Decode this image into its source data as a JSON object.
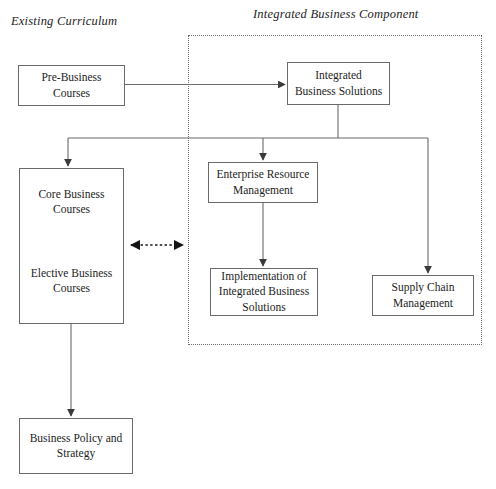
{
  "diagram": {
    "type": "flowchart",
    "title_labels": {
      "existing_curriculum": "Existing Curriculum",
      "integrated_business_component": "Integrated Business Component"
    },
    "colors": {
      "stroke": "#6a6a6a",
      "text": "#1d1d1d",
      "dotted_border": "#6d6d6d",
      "background": "#ffffff"
    },
    "nodes": {
      "pre_business": {
        "lines": [
          "Pre-Business",
          "Courses"
        ]
      },
      "integrated_solutions": {
        "lines": [
          "Integrated",
          "Business Solutions"
        ]
      },
      "erm": {
        "lines": [
          "Enterprise Resource",
          "Management"
        ]
      },
      "implementation": {
        "lines": [
          "Implementation of",
          "Integrated Business",
          "Solutions"
        ]
      },
      "supply_chain": {
        "lines": [
          "Supply Chain",
          "Management"
        ]
      },
      "business_policy": {
        "lines": [
          "Business Policy and",
          "Strategy"
        ]
      },
      "curriculum_stack": {
        "core": {
          "lines": [
            "Core Business",
            "Courses"
          ]
        },
        "elective": {
          "lines": [
            "Elective Business",
            "Courses"
          ]
        }
      }
    },
    "edges": [
      {
        "name": "pre-business-to-integrated-solutions",
        "style": "solid",
        "arrows": "single"
      },
      {
        "name": "integrated-solutions-to-bus",
        "style": "solid",
        "arrows": "none"
      },
      {
        "name": "bus-to-core-business",
        "style": "solid",
        "arrows": "single"
      },
      {
        "name": "bus-to-erm",
        "style": "solid",
        "arrows": "single"
      },
      {
        "name": "bus-to-supply-chain",
        "style": "solid",
        "arrows": "single"
      },
      {
        "name": "erm-to-implementation",
        "style": "solid",
        "arrows": "single"
      },
      {
        "name": "curriculum-to-integrated-component",
        "style": "dotted",
        "arrows": "double"
      },
      {
        "name": "curriculum-to-business-policy",
        "style": "solid",
        "arrows": "single"
      }
    ]
  }
}
